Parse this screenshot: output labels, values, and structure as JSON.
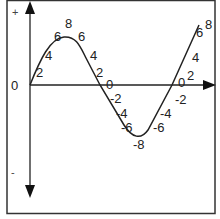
{
  "diagram": {
    "title": "",
    "axis_labels": {
      "plus": "+",
      "minus": "-",
      "zero": "0"
    },
    "colors": {
      "line": "#222222",
      "frame": "#333333",
      "background": "#ffffff"
    },
    "curve": "sine",
    "point_labels": [
      {
        "text": "2",
        "x": 36,
        "y": 66
      },
      {
        "text": "4",
        "x": 45,
        "y": 49
      },
      {
        "text": "6",
        "x": 54,
        "y": 30
      },
      {
        "text": "8",
        "x": 65,
        "y": 17
      },
      {
        "text": "6",
        "x": 78,
        "y": 30
      },
      {
        "text": "4",
        "x": 90,
        "y": 49
      },
      {
        "text": "2",
        "x": 96,
        "y": 66
      },
      {
        "text": "0",
        "x": 106,
        "y": 78
      },
      {
        "text": "-2",
        "x": 110,
        "y": 92
      },
      {
        "text": "-4",
        "x": 116,
        "y": 107
      },
      {
        "text": "-6",
        "x": 121,
        "y": 121
      },
      {
        "text": "-8",
        "x": 133,
        "y": 138
      },
      {
        "text": "-6",
        "x": 153,
        "y": 121
      },
      {
        "text": "-4",
        "x": 160,
        "y": 107
      },
      {
        "text": "-2",
        "x": 175,
        "y": 93
      },
      {
        "text": "0",
        "x": 178,
        "y": 76
      },
      {
        "text": "2",
        "x": 187,
        "y": 69
      },
      {
        "text": "4",
        "x": 192,
        "y": 51
      },
      {
        "text": "6",
        "x": 196,
        "y": 26
      },
      {
        "text": "8",
        "x": 205,
        "y": 18
      }
    ]
  }
}
